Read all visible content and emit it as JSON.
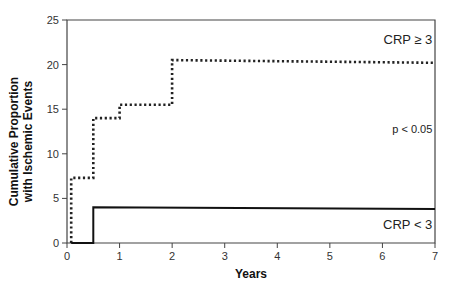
{
  "chart_data": {
    "type": "line",
    "subtype": "kaplan-meier-step",
    "title": "",
    "xlabel": "Years",
    "ylabel": "Cumulative Proportion with Ischemic Events",
    "ylabel_lines": [
      "Cumulative Proportion",
      "with Ischemic Events"
    ],
    "xlim": [
      0,
      7
    ],
    "ylim": [
      0,
      25
    ],
    "xticks": [
      0,
      1,
      2,
      3,
      4,
      5,
      6,
      7
    ],
    "yticks": [
      0,
      5,
      10,
      15,
      20,
      25
    ],
    "grid": false,
    "legend": "inline annotations",
    "series": [
      {
        "name": "CRP ≥ 3",
        "style": "dotted",
        "color": "#222222",
        "x": [
          0.08,
          0.08,
          0.5,
          0.5,
          1.0,
          1.0,
          2.0,
          2.0,
          7.0
        ],
        "y": [
          0,
          7.3,
          7.3,
          14.0,
          14.0,
          15.5,
          15.5,
          20.5,
          20.2
        ]
      },
      {
        "name": "CRP < 3",
        "style": "solid",
        "color": "#111111",
        "x": [
          0.08,
          0.5,
          0.5,
          7.0
        ],
        "y": [
          0,
          0,
          4.0,
          3.8
        ]
      }
    ],
    "annotations": [
      {
        "text": "CRP ≥ 3",
        "x": 6.95,
        "y": 22.3
      },
      {
        "text": "p < 0.05",
        "x": 6.95,
        "y": 12.3
      },
      {
        "text": "CRP < 3",
        "x": 6.95,
        "y": 1.6
      }
    ]
  },
  "plot": {
    "left_px": 67,
    "right_px": 435,
    "top_px": 20,
    "bottom_px": 243
  }
}
